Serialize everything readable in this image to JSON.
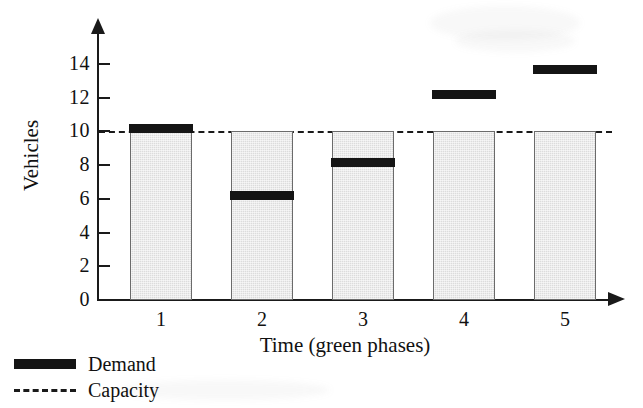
{
  "chart_data": {
    "type": "bar",
    "title": "",
    "xlabel": "Time (green phases)",
    "ylabel": "Vehicles",
    "categories": [
      "1",
      "2",
      "3",
      "4",
      "5"
    ],
    "xlim": [
      0.5,
      5.5
    ],
    "ylim": [
      0,
      15
    ],
    "yticks": [
      0,
      2,
      4,
      6,
      8,
      10,
      12,
      14
    ],
    "ytick_labels": [
      "0",
      "2",
      "4",
      "6",
      "8",
      "10",
      "12",
      "14"
    ],
    "grid": false,
    "legend_position": "below-left",
    "series": [
      {
        "name": "Capacity",
        "style": "bar-filled-gray-with-dashed-reference-line",
        "reference_value": 10,
        "values": [
          10,
          10,
          10,
          10,
          10
        ]
      },
      {
        "name": "Demand",
        "style": "solid-black-horizontal-band",
        "values": [
          10.2,
          6.2,
          8.2,
          12.2,
          13.7
        ]
      }
    ]
  },
  "axes": {
    "y_title": "Vehicles",
    "x_title": "Time (green phases)",
    "y_ticks": [
      {
        "label": "14",
        "value": 14
      },
      {
        "label": "12",
        "value": 12
      },
      {
        "label": "10",
        "value": 10
      },
      {
        "label": "8",
        "value": 8
      },
      {
        "label": "6",
        "value": 6
      },
      {
        "label": "4",
        "value": 4
      },
      {
        "label": "2",
        "value": 2
      },
      {
        "label": "0",
        "value": 0
      }
    ],
    "x_ticks": [
      {
        "label": "1",
        "value": 1
      },
      {
        "label": "2",
        "value": 2
      },
      {
        "label": "3",
        "value": 3
      },
      {
        "label": "4",
        "value": 4
      },
      {
        "label": "5",
        "value": 5
      }
    ]
  },
  "legend": {
    "items": [
      {
        "label": "Demand",
        "swatch": "solid-black-bar",
        "color": "#141414"
      },
      {
        "label": "Capacity",
        "swatch": "dashed-line",
        "color": "#1a1a1a"
      }
    ]
  },
  "colors": {
    "bar_fill": "#dcdcdc",
    "bar_stroke": "#6b6b6b",
    "demand": "#141414",
    "axis": "#1a1a1a",
    "background": "#ffffff"
  }
}
